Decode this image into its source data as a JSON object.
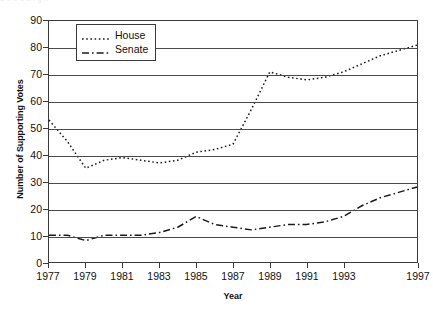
{
  "figure": {
    "scan_artifact_text": "a  b  c   d   e    f    g   h",
    "background_color": "#ffffff",
    "axis_color": "#3a3a3a",
    "series_color": "#1a1a1a"
  },
  "chart_data": {
    "type": "line",
    "title": "",
    "xlabel": "Year",
    "ylabel": "Number of Supporting Votes",
    "xlim": [
      1977,
      1997
    ],
    "ylim": [
      0,
      90
    ],
    "ytick_values": [
      0,
      10,
      20,
      30,
      40,
      50,
      60,
      70,
      80,
      90
    ],
    "ytick_labels": [
      "0",
      "10",
      "20",
      "30",
      "40",
      "50",
      "60",
      "70",
      "80",
      "90"
    ],
    "xtick_values": [
      1977,
      1979,
      1981,
      1983,
      1985,
      1987,
      1989,
      1991,
      1993,
      1997
    ],
    "xtick_labels": [
      "1977",
      "1979",
      "1981",
      "1983",
      "1985",
      "1987",
      "1989",
      "1991",
      "1993",
      "1997"
    ],
    "grid": "horizontal",
    "legend_position": "upper-left-inside",
    "x": [
      1977,
      1978,
      1979,
      1980,
      1981,
      1982,
      1983,
      1984,
      1985,
      1986,
      1987,
      1988,
      1989,
      1990,
      1991,
      1992,
      1993,
      1994,
      1995,
      1996,
      1997
    ],
    "series": [
      {
        "name": "House",
        "linestyle": "dotted",
        "dash_pattern": "1.6 2.6",
        "values": [
          53,
          45,
          35,
          38,
          39,
          38,
          37,
          38,
          41,
          42,
          44,
          57,
          71,
          69,
          68,
          69,
          71,
          74,
          77,
          79,
          81
        ]
      },
      {
        "name": "Senate",
        "linestyle": "dash-dot",
        "dash_pattern": "7 3 1.6 3",
        "values": [
          10,
          10,
          8,
          10,
          10,
          10,
          11,
          13,
          17,
          14,
          13,
          12,
          13,
          14,
          14,
          15,
          17,
          21,
          24,
          26,
          28
        ]
      }
    ]
  },
  "legend": {
    "items": [
      {
        "label": "House"
      },
      {
        "label": "Senate"
      }
    ]
  }
}
